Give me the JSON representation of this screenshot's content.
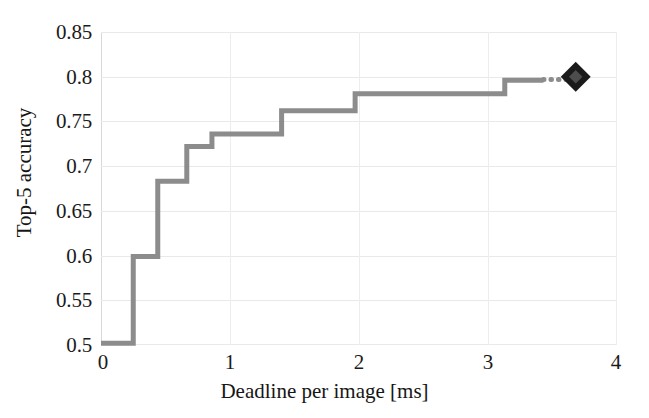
{
  "chart_data": {
    "type": "line",
    "subtype": "step-post",
    "title": "",
    "xlabel": "Deadline per image [ms]",
    "ylabel": "Top-5 accuracy",
    "xlim": [
      0,
      4
    ],
    "ylim": [
      0.5,
      0.85
    ],
    "xticks": [
      "0",
      "1",
      "2",
      "3",
      "4"
    ],
    "xtick_values": [
      0,
      1,
      2,
      3,
      4
    ],
    "yticks": [
      "0.5",
      "0.55",
      "0.6",
      "0.65",
      "0.7",
      "0.75",
      "0.8",
      "0.85"
    ],
    "ytick_values": [
      0.5,
      0.55,
      0.6,
      0.65,
      0.7,
      0.75,
      0.8,
      0.85
    ],
    "grid": true,
    "legend": "none",
    "line_color": "#8c8c8c",
    "line_width": 5,
    "marker_color": "#1a1a1a",
    "x": [
      0.0,
      0.25,
      0.44,
      0.665,
      0.86,
      1.4,
      1.97,
      3.13,
      3.43
    ],
    "y": [
      0.502,
      0.599,
      0.683,
      0.722,
      0.736,
      0.762,
      0.781,
      0.796,
      0.796
    ],
    "steps": [
      {
        "x_start": 0.0,
        "x_end": 0.25,
        "value": 0.502
      },
      {
        "x_start": 0.25,
        "x_end": 0.44,
        "value": 0.599
      },
      {
        "x_start": 0.44,
        "x_end": 0.665,
        "value": 0.683
      },
      {
        "x_start": 0.665,
        "x_end": 0.86,
        "value": 0.722
      },
      {
        "x_start": 0.86,
        "x_end": 1.4,
        "value": 0.736
      },
      {
        "x_start": 1.4,
        "x_end": 1.97,
        "value": 0.762
      },
      {
        "x_start": 1.97,
        "x_end": 3.13,
        "value": 0.781
      },
      {
        "x_start": 3.13,
        "x_end": 3.43,
        "value": 0.796
      }
    ],
    "dotted_extension": {
      "x_start": 3.43,
      "x_end": 3.62,
      "value": 0.797
    },
    "marker": {
      "x": 3.68,
      "y": 0.8,
      "shape": "diamond",
      "color": "#1a1a1a",
      "size": 30
    }
  }
}
